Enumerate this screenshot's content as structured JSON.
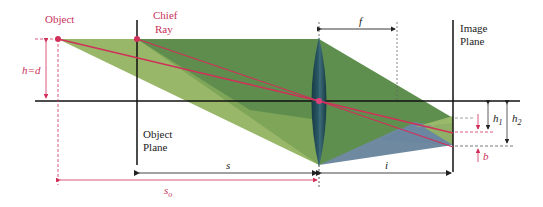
{
  "diagram": {
    "title": "",
    "labels": {
      "object": "Object",
      "chief_ray_1": "Chief",
      "chief_ray_2": "Ray",
      "object_plane_1": "Object",
      "object_plane_2": "Plane",
      "image_plane_1": "Image",
      "image_plane_2": "Plane",
      "h_eq_d": "h=d",
      "focal_length": "f",
      "s": "s",
      "s_o": "s",
      "s_o_sub": "o",
      "i": "i",
      "h1": "h",
      "h1_sub": "1",
      "h2": "h",
      "h2_sub": "2",
      "b": "b"
    },
    "colors": {
      "accent_red": "#d0305a",
      "label_red": "#c8325c",
      "cone_light": "#8fb060",
      "cone_mid": "#6e9a50",
      "cone_dark": "#4f8048",
      "cone_blue": "#6f8aa0",
      "lens": "#1f4a55",
      "axis": "#111111"
    }
  }
}
